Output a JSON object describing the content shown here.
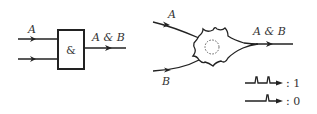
{
  "diagram": {
    "logic_gate": {
      "input_a_label": "A",
      "input_b_label": "",
      "gate_symbol": "&",
      "output_label": "A & B"
    },
    "neuron": {
      "input_a_label": "A",
      "input_b_label": "B",
      "output_label": "A & B"
    },
    "legend": [
      {
        "pulses": 2,
        "label": ": 1"
      },
      {
        "pulses": 1,
        "label": ": 0"
      }
    ]
  },
  "colors": {
    "stroke": "#222222",
    "text": "#333333",
    "background": "#ffffff"
  }
}
